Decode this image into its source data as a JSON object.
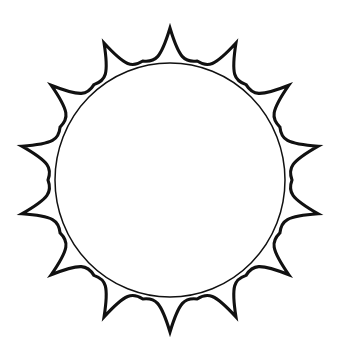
{
  "image": {
    "title": "Sun outline line art",
    "kind": "black-and-white line drawing",
    "subject": "sun",
    "background_color": "#ffffff",
    "stroke_color": "#111111",
    "width": 341,
    "height": 360
  },
  "shapes": {
    "outer_rays": {
      "name": "sun rays outline",
      "ray_count": 14,
      "tip_style": "sharp cusp",
      "valley_style": "sharp cusp",
      "side_style": "concave curve",
      "stroke_width": 3.1,
      "stroke_color": "#111111",
      "fill": "none",
      "center_x": 170,
      "center_y": 180,
      "tip_radius": 152,
      "valley_radius": 122,
      "start_angle_deg": -90
    },
    "inner_circle": {
      "name": "sun disc circle",
      "stroke_width": 1.5,
      "stroke_color": "#111111",
      "fill": "none",
      "center_x": 170,
      "center_y": 180,
      "radius_x": 115,
      "radius_y": 117
    }
  }
}
